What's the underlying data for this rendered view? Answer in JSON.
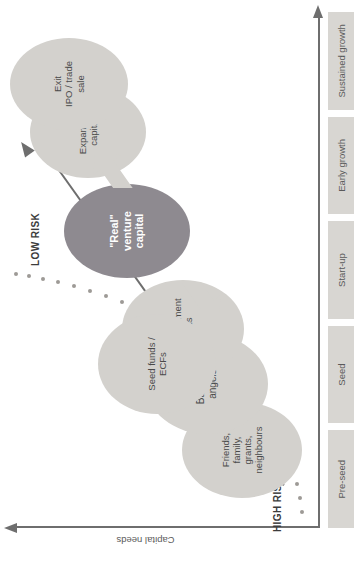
{
  "diagram": {
    "axes": {
      "y_label": "Capital needs",
      "x_label": "Maturity / Time"
    },
    "risk_labels": {
      "high": "HIGH RISK",
      "low": "LOW RISK"
    },
    "stages": [
      {
        "label": "Pre-seed"
      },
      {
        "label": "Seed"
      },
      {
        "label": "Start-up"
      },
      {
        "label": "Early growth"
      },
      {
        "label": "Sustained growth"
      }
    ],
    "funding_sources": [
      {
        "id": "friends-family",
        "lines": [
          "Friends,",
          "family,",
          "grants,",
          "neighbours"
        ],
        "emphasis": "normal"
      },
      {
        "id": "business-angels",
        "lines": [
          "Business",
          "angels"
        ],
        "emphasis": "normal"
      },
      {
        "id": "co-investment-funds",
        "lines": [
          "Co-investment",
          "funds"
        ],
        "emphasis": "normal"
      },
      {
        "id": "seed-funds-ecfs",
        "lines": [
          "Seed funds /",
          "ECFs"
        ],
        "emphasis": "normal"
      },
      {
        "id": "real-venture-capital",
        "lines": [
          "\"Real\"",
          "venture",
          "capital"
        ],
        "emphasis": "highlight"
      },
      {
        "id": "expansion-capital",
        "lines": [
          "Expansion",
          "capital"
        ],
        "emphasis": "normal"
      },
      {
        "id": "exit-ipo-trade-sale",
        "lines": [
          "Exit",
          "IPO / trade",
          "sale"
        ],
        "emphasis": "normal"
      }
    ],
    "connectors": [
      {
        "id": "arrow-up-to-expansion",
        "direction": "up"
      },
      {
        "id": "arrow-down-to-seed-stage",
        "direction": "down"
      }
    ],
    "colors": {
      "bubble_fill": "#d3d1cd",
      "bubble_highlight_fill": "#8e8a90",
      "chip_fill": "#d8d6d2",
      "axis": "#6e6e6e",
      "risk_curve": "#9d9a96",
      "trend_line": "#6e6e6e",
      "text": "#4a4a4a"
    }
  }
}
